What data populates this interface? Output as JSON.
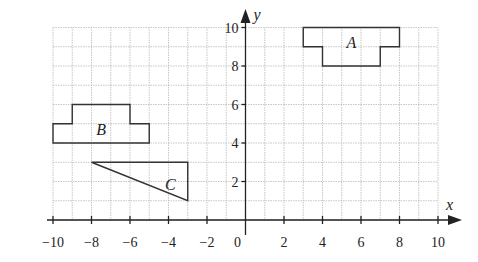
{
  "diagram": {
    "type": "coordinate-grid",
    "x_axis": {
      "label": "x",
      "min": -10,
      "max": 10,
      "ticks": [
        "−10",
        "−8",
        "−6",
        "−4",
        "−2",
        "0",
        "2",
        "4",
        "6",
        "8",
        "10"
      ],
      "tick_values": [
        -10,
        -8,
        -6,
        -4,
        -2,
        0,
        2,
        4,
        6,
        8,
        10
      ]
    },
    "y_axis": {
      "label": "y",
      "min": 0,
      "max": 10,
      "ticks": [
        "2",
        "4",
        "6",
        "8",
        "10"
      ],
      "tick_values": [
        2,
        4,
        6,
        8,
        10
      ]
    },
    "grid": {
      "x_min": -10,
      "x_max": 10,
      "y_min": 0,
      "y_max": 10,
      "step": 1
    },
    "shapes": [
      {
        "name": "A",
        "label": "A",
        "label_pos": [
          5.5,
          9.2
        ],
        "points": [
          [
            3,
            10
          ],
          [
            8,
            10
          ],
          [
            8,
            9
          ],
          [
            7,
            9
          ],
          [
            7,
            8
          ],
          [
            4,
            8
          ],
          [
            4,
            9
          ],
          [
            3,
            9
          ]
        ]
      },
      {
        "name": "B",
        "label": "B",
        "label_pos": [
          -7.5,
          4.7
        ],
        "points": [
          [
            -10,
            4
          ],
          [
            -5,
            4
          ],
          [
            -5,
            5
          ],
          [
            -6,
            5
          ],
          [
            -6,
            6
          ],
          [
            -9,
            6
          ],
          [
            -9,
            5
          ],
          [
            -10,
            5
          ]
        ]
      },
      {
        "name": "C",
        "label": "C",
        "label_pos": [
          -3.9,
          1.8
        ],
        "points": [
          [
            -8,
            3
          ],
          [
            -3,
            3
          ],
          [
            -3,
            1
          ]
        ]
      }
    ]
  }
}
